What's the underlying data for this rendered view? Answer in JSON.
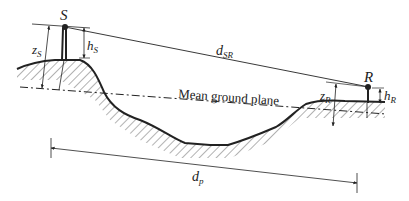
{
  "diagram": {
    "labels": {
      "source": "S",
      "receiver": "R",
      "z_source_main": "z",
      "z_source_sub": "S",
      "h_source_main": "h",
      "h_source_sub": "S",
      "d_sr_main": "d",
      "d_sr_sub": "SR",
      "z_receiver_main": "z",
      "z_receiver_sub": "R",
      "h_receiver_main": "h",
      "h_receiver_sub": "R",
      "d_p_main": "d",
      "d_p_sub": "p",
      "mean_ground_plane": "Mean ground plane"
    },
    "colors": {
      "ink": "#222222",
      "hatch": "#555555",
      "background": "#ffffff"
    }
  }
}
